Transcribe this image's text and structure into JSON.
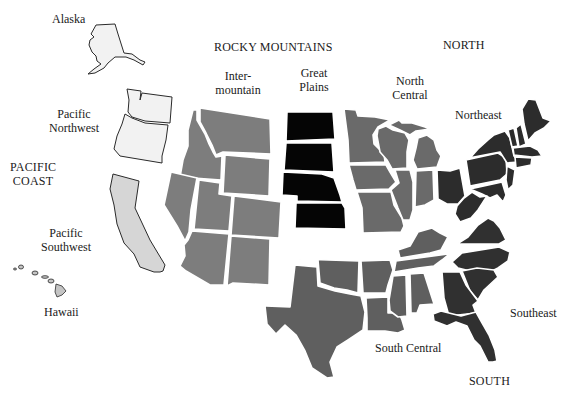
{
  "colors": {
    "pacific_northwest": "#f2f2f2",
    "pacific_southwest": "#d6d6d6",
    "alaska": "#f2f2f2",
    "hawaii": "#c4c4c4",
    "intermountain": "#7d7d7d",
    "great_plains": "#050505",
    "north_central": "#6a6a6a",
    "northeast": "#2c2c2c",
    "south_central": "#5f5f5f",
    "southeast": "#303030"
  },
  "labels": {
    "alaska": "Alaska",
    "pacific_northwest": "Pacific\nNorthwest",
    "pacific_coast": "PACIFIC\nCOAST",
    "pacific_southwest": "Pacific\nSouthwest",
    "hawaii": "Hawaii",
    "rocky_mountains": "ROCKY MOUNTAINS",
    "intermountain": "Inter-\nmountain",
    "great_plains": "Great\nPlains",
    "north": "NORTH",
    "north_central": "North\nCentral",
    "northeast": "Northeast",
    "southeast": "Southeast",
    "south_central": "South Central",
    "south": "SOUTH"
  },
  "regions": [
    {
      "name": "Pacific Coast",
      "subregions": [
        "Pacific Northwest",
        "Pacific Southwest",
        "Alaska",
        "Hawaii"
      ]
    },
    {
      "name": "Rocky Mountains",
      "subregions": [
        "Intermountain",
        "Great Plains"
      ]
    },
    {
      "name": "North",
      "subregions": [
        "North Central",
        "Northeast"
      ]
    },
    {
      "name": "South",
      "subregions": [
        "South Central",
        "Southeast"
      ]
    }
  ]
}
